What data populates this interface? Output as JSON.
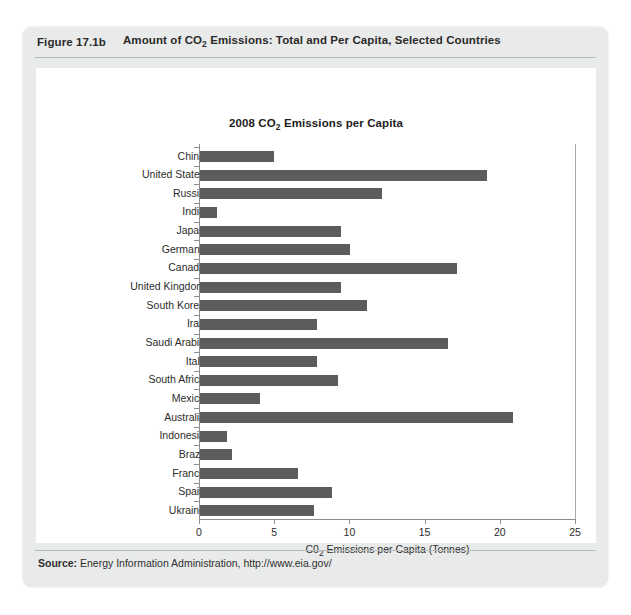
{
  "figure": {
    "number": "Figure 17.1b",
    "title_pre": "Amount of CO",
    "title_sub": "2",
    "title_post": " Emissions: Total and Per Capita, Selected Countries"
  },
  "source": {
    "label": "Source:",
    "text": " Energy Information Administration, http://www.eia.gov/"
  },
  "colors": {
    "bar": "#5c5c5c",
    "card_background": "#e9eaea",
    "panel_background": "#ffffff",
    "rule": "#b9bcbd",
    "axis": "#8e8e8e"
  },
  "chart_data": {
    "type": "bar",
    "orientation": "horizontal",
    "title": "2008 CO2 Emissions per Capita",
    "title_pre": "2008 CO",
    "title_sub": "2",
    "title_post": " Emissions per Capita",
    "xlabel": "C02 Emissions per Capita (Tonnes)",
    "xlabel_pre": "C0",
    "xlabel_sub": "2",
    "xlabel_post": " Emissions per Capita (Tonnes)",
    "ylabel": "",
    "xlim": [
      0,
      25
    ],
    "xticks": [
      0,
      5,
      10,
      15,
      20,
      25
    ],
    "xtick_labels": [
      "0",
      "5",
      "10",
      "15",
      "20",
      "25"
    ],
    "grid": false,
    "legend": false,
    "categories": [
      "China",
      "United States",
      "Russia",
      "India",
      "Japan",
      "Germany",
      "Canada",
      "United Kingdom",
      "South Korea",
      "Iran",
      "Saudi Arabia",
      "Italy",
      "South Africa",
      "Mexico",
      "Australia",
      "Indonesia",
      "Brazil",
      "France",
      "Spain",
      "Ukraine"
    ],
    "values": [
      4.9,
      19.1,
      12.1,
      1.1,
      9.4,
      10.0,
      17.1,
      9.4,
      11.1,
      7.8,
      16.5,
      7.8,
      9.2,
      4.0,
      20.8,
      1.8,
      2.1,
      6.5,
      8.8,
      7.6
    ],
    "units": "Tonnes per capita"
  }
}
